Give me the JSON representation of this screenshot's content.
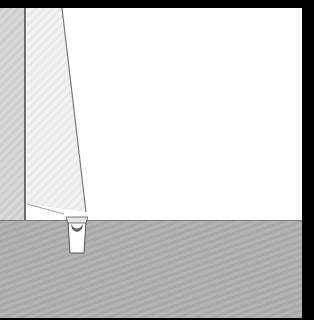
{
  "scene": {
    "description": "3D rendered interior scene: left wall, white back wall, slanted panel, gray floor and a small cup-like object",
    "colors": {
      "frame": "#000000",
      "back_wall": "#ffffff",
      "left_wall": "#d3d3d3",
      "floor": "#aeaeae",
      "edge": "#6a6a6a"
    }
  }
}
